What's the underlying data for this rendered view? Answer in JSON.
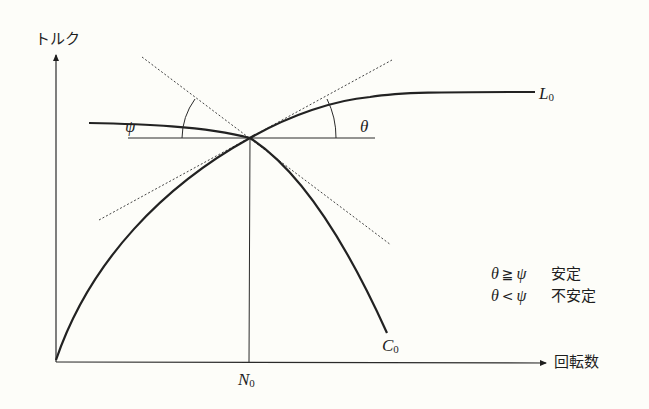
{
  "diagram": {
    "type": "torque-speed stability diagram",
    "axes": {
      "y_label": "トルク",
      "x_label": "回転数",
      "x_marker_label": "N",
      "x_marker_sub": "0"
    },
    "curves": [
      {
        "id": "L0",
        "label": "L",
        "sub": "0",
        "description": "load torque curve, rising then flat"
      },
      {
        "id": "C0",
        "label": "C",
        "sub": "0",
        "description": "motor torque curve, rising then falling"
      }
    ],
    "angles": [
      {
        "symbol": "ψ",
        "description": "angle between C0 tangent and horizontal"
      },
      {
        "symbol": "θ",
        "description": "angle between L0 tangent and horizontal"
      }
    ],
    "legend": [
      {
        "left": "θ",
        "op": "≧",
        "right": "ψ",
        "text": "安定"
      },
      {
        "left": "θ",
        "op": "<",
        "right": "ψ",
        "text": "不安定"
      }
    ]
  }
}
